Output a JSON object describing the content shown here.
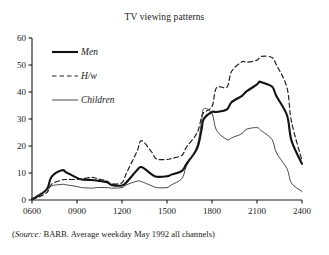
{
  "chart_data": {
    "type": "line",
    "title": "TV viewing patterns",
    "xlabel": "",
    "ylabel": "",
    "xlim": [
      600,
      2400
    ],
    "ylim": [
      0,
      60
    ],
    "grid": false,
    "legend_position": "top-left",
    "x_ticks": [
      "0600",
      "0900",
      "1200",
      "1500",
      "1800",
      "2100",
      "2400"
    ],
    "x_tick_values": [
      600,
      900,
      1200,
      1500,
      1800,
      2100,
      2400
    ],
    "y_ticks": [
      "0",
      "10",
      "20",
      "30",
      "40",
      "50",
      "60"
    ],
    "y_tick_values": [
      0,
      10,
      20,
      30,
      40,
      50,
      60
    ],
    "annotation": "(Source: BARB. Average weekday May 1992 all channels)",
    "source_label": "Source:",
    "source_rest": " BARB. Average weekday May 1992 all channels)",
    "source_open": "(",
    "series": [
      {
        "name": "Men",
        "style": "solid-thick",
        "color": "#111111",
        "width": 2.1,
        "x": [
          600,
          630,
          700,
          730,
          800,
          830,
          900,
          930,
          1000,
          1030,
          1100,
          1130,
          1200,
          1230,
          1300,
          1330,
          1400,
          1430,
          1500,
          1530,
          1600,
          1630,
          1700,
          1730,
          1745,
          1800,
          1830,
          1900,
          1930,
          2000,
          2030,
          2100,
          2115,
          2130,
          2200,
          2230,
          2300,
          2330,
          2400
        ],
        "values": [
          0.4,
          1.2,
          4.0,
          8.6,
          11.0,
          10.2,
          8.2,
          7.6,
          7.4,
          7.2,
          6.6,
          5.6,
          5.4,
          6.6,
          11.0,
          12.2,
          9.4,
          8.6,
          8.8,
          9.4,
          10.8,
          13.4,
          19.0,
          26.0,
          30.0,
          32.6,
          32.6,
          33.6,
          36.2,
          38.6,
          40.2,
          42.8,
          43.8,
          43.6,
          42.0,
          38.4,
          31.4,
          22.0,
          13.4
        ]
      },
      {
        "name": "H/w",
        "style": "dashed",
        "color": "#222222",
        "width": 1.2,
        "x": [
          600,
          630,
          700,
          730,
          800,
          830,
          900,
          930,
          1000,
          1030,
          1100,
          1130,
          1200,
          1230,
          1300,
          1330,
          1400,
          1430,
          1500,
          1530,
          1600,
          1630,
          1700,
          1730,
          1745,
          1800,
          1830,
          1900,
          1930,
          2000,
          2030,
          2100,
          2130,
          2200,
          2230,
          2300,
          2330,
          2400
        ],
        "values": [
          0.2,
          0.8,
          2.8,
          5.8,
          7.4,
          7.6,
          7.6,
          7.8,
          8.4,
          8.0,
          7.0,
          6.0,
          6.4,
          10.0,
          18.0,
          22.0,
          17.6,
          15.2,
          15.0,
          15.4,
          16.6,
          19.6,
          24.8,
          30.6,
          32.4,
          34.6,
          41.6,
          41.8,
          47.6,
          51.2,
          51.0,
          51.8,
          53.2,
          52.8,
          50.0,
          41.6,
          29.0,
          14.6
        ]
      },
      {
        "name": "Children",
        "style": "solid-thin",
        "color": "#333333",
        "width": 0.9,
        "x": [
          600,
          630,
          700,
          730,
          800,
          830,
          900,
          930,
          1000,
          1030,
          1100,
          1130,
          1200,
          1230,
          1300,
          1330,
          1400,
          1430,
          1500,
          1530,
          1600,
          1630,
          1700,
          1730,
          1745,
          1800,
          1830,
          1900,
          1930,
          2000,
          2030,
          2100,
          2130,
          2200,
          2230,
          2300,
          2330,
          2400
        ],
        "values": [
          0.3,
          1.4,
          3.6,
          5.2,
          5.8,
          5.6,
          5.0,
          4.6,
          4.4,
          4.6,
          4.6,
          4.4,
          4.6,
          5.6,
          7.0,
          6.8,
          5.2,
          4.6,
          4.6,
          5.6,
          8.0,
          12.6,
          20.0,
          29.0,
          33.8,
          32.0,
          25.8,
          22.4,
          23.0,
          24.6,
          26.2,
          26.8,
          25.6,
          22.4,
          17.4,
          11.6,
          6.2,
          3.2
        ]
      }
    ]
  },
  "axes": {
    "y_axis_name": "viewers-axis",
    "x_axis_name": "time-axis"
  },
  "legend": {
    "items": [
      {
        "label": "Men",
        "style": "solid-thick"
      },
      {
        "label": "H/w",
        "style": "dashed"
      },
      {
        "label": "Children",
        "style": "solid-thin"
      }
    ]
  }
}
